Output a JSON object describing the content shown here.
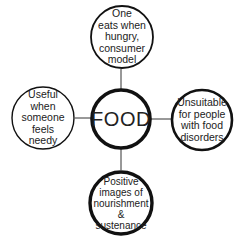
{
  "diagram": {
    "type": "hub-and-spoke",
    "stroke_color": "#111111",
    "background": "#ffffff",
    "center": {
      "label": "FOOD"
    },
    "nodes": {
      "top": {
        "label": "One eats when hungry, consumer model",
        "lines": [
          "One",
          "eats when",
          "hungry,",
          "consumer",
          "model"
        ]
      },
      "left": {
        "label": "Useful when someone feels needy",
        "lines": [
          "Useful",
          "when",
          "someone",
          "feels",
          "needy"
        ]
      },
      "right": {
        "label": "Unsuitable for people with food disorders",
        "lines": [
          "Unsuitable",
          "for people",
          "with food",
          "disorders"
        ]
      },
      "bottom": {
        "label": "Positive images of nourishment & sustenance",
        "lines": [
          "Positive",
          "images of",
          "nourishment",
          "&",
          "sustenance"
        ]
      }
    }
  }
}
